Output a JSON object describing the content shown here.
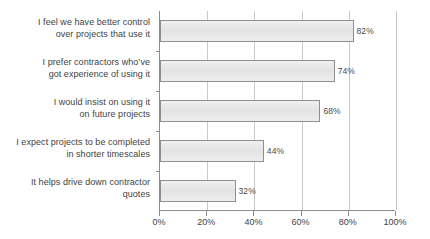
{
  "chart_data": {
    "type": "bar",
    "orientation": "horizontal",
    "title": "",
    "subtitle": "",
    "xlabel": "",
    "ylabel": "",
    "xlim": [
      0,
      100
    ],
    "grid": true,
    "legend": false,
    "categories": [
      "I feel we have better control\nover projects that use it",
      "I prefer contractors who’ve\ngot experience of using it",
      "I would insist on using it\non future projects",
      "I expect projects to be completed\nin shorter timescales",
      "It helps drive down contractor\nquotes"
    ],
    "values": [
      82,
      74,
      68,
      44,
      32
    ],
    "value_labels": [
      "82%",
      "74%",
      "68%",
      "44%",
      "32%"
    ],
    "xticks": [
      0,
      20,
      40,
      60,
      80,
      100
    ],
    "xtick_labels": [
      "0%",
      "20%",
      "40%",
      "60%",
      "80%",
      "100%"
    ],
    "colors": {
      "bar_fill": "#e8e8e8",
      "bar_border": "#8f8f8f",
      "gridline": "#c9c9c9",
      "axis": "#8c8c8c",
      "text": "#3f3f3f"
    }
  },
  "categories_display": [
    {
      "line1": "I feel we have better control",
      "line2": "over projects that use it"
    },
    {
      "line1": "I prefer contractors who’ve",
      "line2": "got experience of using it"
    },
    {
      "line1": "I would insist on using it",
      "line2": "on future projects"
    },
    {
      "line1": "I expect projects to be completed",
      "line2": "in shorter timescales"
    },
    {
      "line1": "It helps drive down contractor",
      "line2": "quotes"
    }
  ]
}
